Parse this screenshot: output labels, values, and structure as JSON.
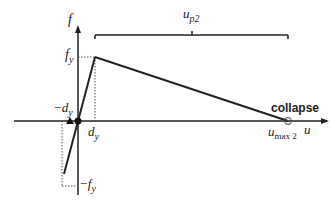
{
  "diagram": {
    "axes": {
      "x_label": "u",
      "y_label": "f"
    },
    "labels": {
      "fy": "f",
      "fy_sub": "y",
      "neg_fy": "−f",
      "neg_fy_sub": "y",
      "dy": "d",
      "dy_sub": "y",
      "neg_dy": "−d",
      "neg_dy_sub": "y",
      "up2": "u",
      "up2_sub": "p2",
      "umax2": "u",
      "umax2_sub": "max 2",
      "collapse": "collapse"
    },
    "colors": {
      "line": "#222222",
      "dotted": "#555555"
    }
  }
}
